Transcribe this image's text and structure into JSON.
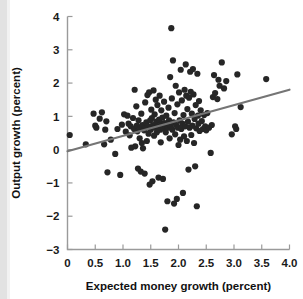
{
  "chart_data": {
    "type": "scatter",
    "title": "",
    "xlabel": "Expected money growth (percent)",
    "ylabel": "Output growth (percent)",
    "xlim": [
      0,
      4.0
    ],
    "ylim": [
      -3,
      4
    ],
    "xticks": [
      0,
      0.5,
      1.0,
      1.5,
      2.0,
      2.5,
      3.0,
      3.5,
      4.0
    ],
    "xticklabels": [
      "0",
      "0.5",
      "1.0",
      "1.5",
      "2.0",
      "2.5",
      "3.0",
      "3.5",
      "4.0"
    ],
    "yticks": [
      -3,
      -2,
      -1,
      0,
      1,
      2,
      3,
      4
    ],
    "yticklabels": [
      "−3",
      "−2",
      "−1",
      "0",
      "1",
      "2",
      "3",
      "4"
    ],
    "grid": false,
    "legend": "none",
    "marker_color": "#262626",
    "marker_size": 3.1,
    "trendline": {
      "type": "linear-fit",
      "color": "#757575",
      "x0": 0.0,
      "y0": -0.05,
      "x1": 4.0,
      "y1": 1.8
    },
    "points": [
      [
        0.04,
        0.44
      ],
      [
        0.33,
        0.16
      ],
      [
        0.47,
        1.08
      ],
      [
        0.5,
        0.72
      ],
      [
        0.52,
        0.66
      ],
      [
        0.58,
        0.93
      ],
      [
        0.62,
        1.12
      ],
      [
        0.66,
        0.16
      ],
      [
        0.68,
        0.6
      ],
      [
        0.7,
        0.85
      ],
      [
        0.72,
        -0.68
      ],
      [
        0.78,
        0.3
      ],
      [
        0.86,
        -0.13
      ],
      [
        0.9,
        0.62
      ],
      [
        0.95,
        -0.76
      ],
      [
        0.98,
        0.75
      ],
      [
        1.02,
        1.06
      ],
      [
        1.05,
        0.54
      ],
      [
        1.08,
        1.02
      ],
      [
        1.1,
        0.78
      ],
      [
        1.12,
        0.43
      ],
      [
        1.14,
        0.7
      ],
      [
        1.15,
        0.06
      ],
      [
        1.18,
        0.95
      ],
      [
        1.2,
        0.62
      ],
      [
        1.21,
        1.8
      ],
      [
        1.22,
        0.1
      ],
      [
        1.24,
        1.3
      ],
      [
        1.25,
        0.72
      ],
      [
        1.26,
        0.55
      ],
      [
        1.27,
        -0.57
      ],
      [
        1.28,
        0.88
      ],
      [
        1.3,
        0.34
      ],
      [
        1.31,
        0.66
      ],
      [
        1.32,
        -0.66
      ],
      [
        1.33,
        1.08
      ],
      [
        1.34,
        0.2
      ],
      [
        1.35,
        0.74
      ],
      [
        1.36,
        0.04
      ],
      [
        1.38,
        0.58
      ],
      [
        1.39,
        -0.72
      ],
      [
        1.4,
        1.42
      ],
      [
        1.41,
        0.66
      ],
      [
        1.42,
        0.82
      ],
      [
        1.43,
        0.26
      ],
      [
        1.44,
        1.64
      ],
      [
        1.45,
        0.7
      ],
      [
        1.46,
        0.48
      ],
      [
        1.47,
        1.72
      ],
      [
        1.48,
        -1.05
      ],
      [
        1.49,
        0.88
      ],
      [
        1.5,
        0.6
      ],
      [
        1.51,
        1.2
      ],
      [
        1.52,
        0.95
      ],
      [
        1.53,
        -0.95
      ],
      [
        1.54,
        0.74
      ],
      [
        1.55,
        1.78
      ],
      [
        1.56,
        0.42
      ],
      [
        1.57,
        1.06
      ],
      [
        1.58,
        0.66
      ],
      [
        1.59,
        1.5
      ],
      [
        1.6,
        0.84
      ],
      [
        1.61,
        0.52
      ],
      [
        1.62,
        1.34
      ],
      [
        1.63,
        0.7
      ],
      [
        1.64,
        -0.84
      ],
      [
        1.65,
        0.9
      ],
      [
        1.66,
        1.62
      ],
      [
        1.67,
        0.6
      ],
      [
        1.68,
        0.22
      ],
      [
        1.69,
        1.18
      ],
      [
        1.7,
        0.78
      ],
      [
        1.71,
        0.96
      ],
      [
        1.72,
        -0.88
      ],
      [
        1.73,
        0.64
      ],
      [
        1.74,
        1.44
      ],
      [
        1.75,
        0.8
      ],
      [
        1.76,
        -2.4
      ],
      [
        1.77,
        0.52
      ],
      [
        1.78,
        1.02
      ],
      [
        1.79,
        0.74
      ],
      [
        1.8,
        -1.55
      ],
      [
        1.81,
        0.66
      ],
      [
        1.82,
        1.26
      ],
      [
        1.83,
        0.88
      ],
      [
        1.84,
        0.34
      ],
      [
        1.85,
        2.18
      ],
      [
        1.86,
        0.7
      ],
      [
        1.87,
        3.65
      ],
      [
        1.88,
        1.54
      ],
      [
        1.89,
        0.6
      ],
      [
        1.9,
        2.68
      ],
      [
        1.91,
        0.82
      ],
      [
        1.92,
        -1.62
      ],
      [
        1.93,
        1.1
      ],
      [
        1.94,
        0.46
      ],
      [
        1.95,
        1.92
      ],
      [
        1.96,
        0.74
      ],
      [
        1.97,
        -1.48
      ],
      [
        1.98,
        1.36
      ],
      [
        1.99,
        0.66
      ],
      [
        2.0,
        0.14
      ],
      [
        2.01,
        1.72
      ],
      [
        2.02,
        0.88
      ],
      [
        2.03,
        0.3
      ],
      [
        2.04,
        2.4
      ],
      [
        2.05,
        0.62
      ],
      [
        2.06,
        1.48
      ],
      [
        2.07,
        0.78
      ],
      [
        2.08,
        -1.3
      ],
      [
        2.09,
        1.04
      ],
      [
        2.1,
        0.4
      ],
      [
        2.11,
        1.8
      ],
      [
        2.12,
        0.7
      ],
      [
        2.13,
        2.56
      ],
      [
        2.14,
        1.62
      ],
      [
        2.15,
        0.26
      ],
      [
        2.16,
        1.22
      ],
      [
        2.17,
        0.84
      ],
      [
        2.18,
        -0.6
      ],
      [
        2.19,
        1.56
      ],
      [
        2.2,
        0.66
      ],
      [
        2.21,
        2.34
      ],
      [
        2.22,
        1.74
      ],
      [
        2.23,
        0.44
      ],
      [
        2.24,
        1.08
      ],
      [
        2.25,
        0.72
      ],
      [
        2.26,
        2.42
      ],
      [
        2.27,
        1.66
      ],
      [
        2.28,
        0.2
      ],
      [
        2.29,
        0.92
      ],
      [
        2.3,
        -0.5
      ],
      [
        2.31,
        1.34
      ],
      [
        2.32,
        0.64
      ],
      [
        2.33,
        -1.7
      ],
      [
        2.34,
        2.28
      ],
      [
        2.35,
        1.02
      ],
      [
        2.36,
        0.78
      ],
      [
        2.37,
        1.46
      ],
      [
        2.38,
        0.56
      ],
      [
        2.4,
        1.18
      ],
      [
        2.42,
        0.86
      ],
      [
        2.44,
        0.62
      ],
      [
        2.46,
        1.04
      ],
      [
        2.48,
        0.7
      ],
      [
        2.5,
        0.58
      ],
      [
        2.52,
        1.1
      ],
      [
        2.55,
        0.66
      ],
      [
        2.58,
        -0.1
      ],
      [
        2.6,
        0.74
      ],
      [
        2.62,
        1.58
      ],
      [
        2.64,
        2.24
      ],
      [
        2.66,
        1.7
      ],
      [
        2.7,
        1.52
      ],
      [
        2.72,
        2.1
      ],
      [
        2.74,
        1.92
      ],
      [
        2.78,
        2.62
      ],
      [
        2.82,
        1.84
      ],
      [
        2.86,
        2.06
      ],
      [
        2.96,
        0.46
      ],
      [
        3.02,
        0.7
      ],
      [
        3.04,
        0.62
      ],
      [
        3.06,
        2.26
      ],
      [
        3.12,
        1.28
      ],
      [
        3.58,
        2.12
      ]
    ]
  }
}
